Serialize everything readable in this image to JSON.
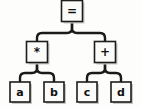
{
  "diagram": {
    "type": "binary-expression-tree",
    "background_color": "#fdfdfb",
    "stroke_color": "#1a1a1a",
    "node_fill_color": "#fbfbf9",
    "shadow_color": "#c9c9c4",
    "nodes": [
      {
        "id": "root",
        "label": "=",
        "kind": "operator",
        "x": 72,
        "y": 11,
        "w": 21,
        "h": 21
      },
      {
        "id": "mul",
        "label": "*",
        "kind": "operator",
        "x": 37,
        "y": 52,
        "w": 21,
        "h": 21
      },
      {
        "id": "plus",
        "label": "+",
        "kind": "operator",
        "x": 105,
        "y": 52,
        "w": 21,
        "h": 21
      },
      {
        "id": "a",
        "label": "a",
        "kind": "leaf",
        "x": 20,
        "y": 92,
        "w": 20,
        "h": 20
      },
      {
        "id": "b",
        "label": "b",
        "kind": "leaf",
        "x": 54,
        "y": 92,
        "w": 20,
        "h": 20
      },
      {
        "id": "c",
        "label": "c",
        "kind": "leaf",
        "x": 87,
        "y": 92,
        "w": 20,
        "h": 20
      },
      {
        "id": "d",
        "label": "d",
        "kind": "leaf",
        "x": 121,
        "y": 92,
        "w": 20,
        "h": 20
      }
    ],
    "edges": [
      {
        "id": "root-mul",
        "from": "root",
        "to": "mul"
      },
      {
        "id": "root-plus",
        "from": "root",
        "to": "plus"
      },
      {
        "id": "mul-a",
        "from": "mul",
        "to": "a"
      },
      {
        "id": "mul-b",
        "from": "mul",
        "to": "b"
      },
      {
        "id": "plus-c",
        "from": "plus",
        "to": "c"
      },
      {
        "id": "plus-d",
        "from": "plus",
        "to": "d"
      }
    ]
  },
  "labels": {
    "root": "=",
    "mul": "*",
    "plus": "+",
    "a": "a",
    "b": "b",
    "c": "c",
    "d": "d"
  }
}
